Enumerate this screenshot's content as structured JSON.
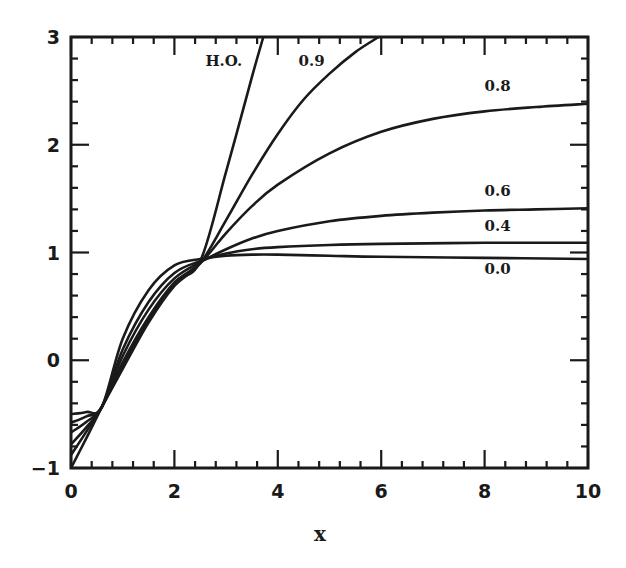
{
  "chart_data": {
    "type": "line",
    "title": "",
    "xlabel": "x",
    "ylabel": "",
    "xlim": [
      0,
      10
    ],
    "ylim": [
      -1,
      3
    ],
    "grid": false,
    "legend": "inline curve labels",
    "x_ticks": [
      "0",
      "2",
      "4",
      "6",
      "8",
      "10"
    ],
    "y_ticks": [
      "-1",
      "0",
      "1",
      "2",
      "3"
    ],
    "line_color": "#1a1a1a",
    "series": [
      {
        "name": "H.O.",
        "label_pos": [
          2.6,
          2.73
        ],
        "points": [
          [
            0,
            -1.0
          ],
          [
            0.3,
            -0.72
          ],
          [
            0.6,
            -0.43
          ],
          [
            1.0,
            -0.05
          ],
          [
            1.5,
            0.38
          ],
          [
            2.0,
            0.72
          ],
          [
            2.5,
            0.92
          ],
          [
            3.0,
            1.75
          ],
          [
            3.5,
            2.63
          ],
          [
            3.72,
            3.0
          ]
        ]
      },
      {
        "name": "0.9",
        "label_pos": [
          4.4,
          2.73
        ],
        "points": [
          [
            0,
            -0.88
          ],
          [
            0.3,
            -0.66
          ],
          [
            0.6,
            -0.43
          ],
          [
            1.0,
            -0.08
          ],
          [
            1.5,
            0.35
          ],
          [
            2.0,
            0.69
          ],
          [
            2.5,
            0.9
          ],
          [
            3.0,
            1.3
          ],
          [
            3.5,
            1.72
          ],
          [
            4.0,
            2.1
          ],
          [
            4.5,
            2.42
          ],
          [
            5.0,
            2.66
          ],
          [
            5.5,
            2.86
          ],
          [
            5.95,
            3.0
          ]
        ]
      },
      {
        "name": "0.8",
        "label_pos": [
          8.0,
          2.5
        ],
        "points": [
          [
            0,
            -0.78
          ],
          [
            0.3,
            -0.62
          ],
          [
            0.6,
            -0.43
          ],
          [
            1.0,
            -0.02
          ],
          [
            1.5,
            0.4
          ],
          [
            2.0,
            0.72
          ],
          [
            2.5,
            0.9
          ],
          [
            3.0,
            1.18
          ],
          [
            3.5,
            1.43
          ],
          [
            4.0,
            1.63
          ],
          [
            5.0,
            1.92
          ],
          [
            6.0,
            2.12
          ],
          [
            7.0,
            2.24
          ],
          [
            8.0,
            2.31
          ],
          [
            9.0,
            2.35
          ],
          [
            10.0,
            2.38
          ]
        ]
      },
      {
        "name": "0.6",
        "label_pos": [
          8.0,
          1.52
        ],
        "points": [
          [
            0,
            -0.67
          ],
          [
            0.3,
            -0.57
          ],
          [
            0.6,
            -0.43
          ],
          [
            1.0,
            0.04
          ],
          [
            1.5,
            0.47
          ],
          [
            2.0,
            0.76
          ],
          [
            2.5,
            0.91
          ],
          [
            3.0,
            1.03
          ],
          [
            3.5,
            1.13
          ],
          [
            4.0,
            1.2
          ],
          [
            5.0,
            1.29
          ],
          [
            6.0,
            1.34
          ],
          [
            7.0,
            1.37
          ],
          [
            8.0,
            1.39
          ],
          [
            9.0,
            1.4
          ],
          [
            10.0,
            1.41
          ]
        ]
      },
      {
        "name": "0.4",
        "label_pos": [
          8.0,
          1.2
        ],
        "points": [
          [
            0,
            -0.58
          ],
          [
            0.3,
            -0.52
          ],
          [
            0.6,
            -0.43
          ],
          [
            1.0,
            0.1
          ],
          [
            1.5,
            0.54
          ],
          [
            2.0,
            0.81
          ],
          [
            2.5,
            0.92
          ],
          [
            3.0,
            0.99
          ],
          [
            3.5,
            1.03
          ],
          [
            4.0,
            1.05
          ],
          [
            5.0,
            1.07
          ],
          [
            6.0,
            1.08
          ],
          [
            8.0,
            1.09
          ],
          [
            10.0,
            1.09
          ]
        ]
      },
      {
        "name": "0.0",
        "label_pos": [
          8.0,
          0.8
        ],
        "points": [
          [
            0,
            -0.5
          ],
          [
            0.3,
            -0.48
          ],
          [
            0.6,
            -0.43
          ],
          [
            1.0,
            0.2
          ],
          [
            1.5,
            0.65
          ],
          [
            2.0,
            0.88
          ],
          [
            2.5,
            0.94
          ],
          [
            3.0,
            0.97
          ],
          [
            3.5,
            0.98
          ],
          [
            4.0,
            0.98
          ],
          [
            5.0,
            0.97
          ],
          [
            6.0,
            0.96
          ],
          [
            8.0,
            0.95
          ],
          [
            10.0,
            0.94
          ]
        ]
      }
    ]
  }
}
